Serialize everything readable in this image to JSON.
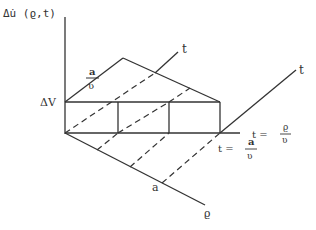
{
  "diagram": {
    "y_axis_label": "Δu̇ (ϱ,t)",
    "level_label": "ΔV",
    "rise_label": {
      "numerator": "a",
      "denominator": "ʋ"
    },
    "t_axis_label_inner": "t",
    "t_axis_label_outer": "t",
    "rho_axis_label": "ϱ",
    "rho_tick_label": "a",
    "t_rho_label": {
      "prefix": "t =",
      "numerator": "ϱ",
      "denominator": "ʋ"
    },
    "t_a_label": {
      "prefix": "t =",
      "numerator": "a",
      "denominator": "ʋ"
    },
    "line_color": "#333333"
  }
}
